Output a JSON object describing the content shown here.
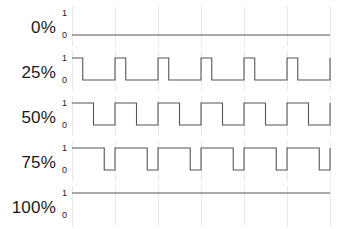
{
  "chart_data": {
    "type": "line",
    "title": "",
    "xlabel": "",
    "ylabel": "",
    "ylim": [
      0,
      1
    ],
    "xlim": [
      0,
      6
    ],
    "grid": true,
    "legend_position": "none",
    "y_tick_labels": [
      "1",
      "0"
    ],
    "period_count": 6,
    "series": [
      {
        "name": "0%",
        "duty_percent": 0,
        "row_label": "0%",
        "values": [
          0,
          0,
          0,
          0,
          0,
          0
        ]
      },
      {
        "name": "25%",
        "duty_percent": 25,
        "row_label": "25%",
        "values": [
          1,
          0,
          1,
          0,
          1,
          0
        ]
      },
      {
        "name": "50%",
        "duty_percent": 50,
        "row_label": "50%",
        "values": [
          1,
          0,
          1,
          0,
          1,
          0
        ]
      },
      {
        "name": "75%",
        "duty_percent": 75,
        "row_label": "75%",
        "values": [
          1,
          0,
          1,
          0,
          1,
          0
        ]
      },
      {
        "name": "100%",
        "duty_percent": 100,
        "row_label": "100%",
        "values": [
          1,
          1,
          1,
          1,
          1,
          1
        ]
      }
    ]
  },
  "rows": [
    {
      "label": "0%",
      "duty": 0,
      "tick_high": "1",
      "tick_low": "0"
    },
    {
      "label": "25%",
      "duty": 25,
      "tick_high": "1",
      "tick_low": "0"
    },
    {
      "label": "50%",
      "duty": 50,
      "tick_high": "1",
      "tick_low": "0"
    },
    {
      "label": "75%",
      "duty": 75,
      "tick_high": "1",
      "tick_low": "0"
    },
    {
      "label": "100%",
      "duty": 100,
      "tick_high": "1",
      "tick_low": "0"
    }
  ],
  "style": {
    "wave_color": "#555555",
    "grid_color": "#e9e9e9",
    "text_color": "#1a1a1a",
    "background": "#ffffff"
  }
}
